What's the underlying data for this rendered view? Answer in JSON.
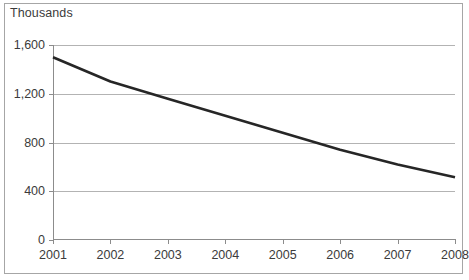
{
  "chart_data": {
    "type": "line",
    "title": "Thousands",
    "xlabel": "",
    "ylabel": "Thousands",
    "x": [
      2001,
      2002,
      2003,
      2004,
      2005,
      2006,
      2007,
      2008
    ],
    "categories": [
      "2001",
      "2002",
      "2003",
      "2004",
      "2005",
      "2006",
      "2007",
      "2008"
    ],
    "series": [
      {
        "name": "Series 1",
        "color": "#262626",
        "values": [
          1500,
          1300,
          1160,
          1020,
          880,
          740,
          620,
          515
        ]
      }
    ],
    "xlim": [
      2001,
      2008
    ],
    "ylim": [
      0,
      1600
    ],
    "y_ticks": [
      0,
      400,
      800,
      1200,
      1600
    ],
    "y_tick_labels": [
      "0",
      "400",
      "800",
      "1,200",
      "1,600"
    ],
    "x_ticks": [
      2001,
      2002,
      2003,
      2004,
      2005,
      2006,
      2007,
      2008
    ],
    "x_tick_labels": [
      "2001",
      "2002",
      "2003",
      "2004",
      "2005",
      "2006",
      "2007",
      "2008"
    ],
    "grid": "horizontal",
    "legend": "none",
    "annotations": [],
    "colors": {
      "line": "#262626",
      "gridline": "#b3b3b3",
      "axis": "#8c8c8c",
      "border": "#a6a6a6",
      "text": "#3b3b3b",
      "background": "#ffffff"
    }
  }
}
